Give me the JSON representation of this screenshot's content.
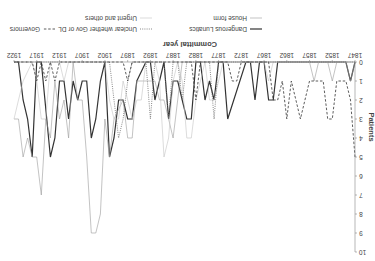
{
  "chart_data": {
    "type": "line",
    "title": "",
    "xlabel": "Committal year",
    "ylabel": "Patients",
    "xlim": [
      1847,
      1922
    ],
    "ylim": [
      0,
      10
    ],
    "x_ticks": [
      1847,
      1852,
      1857,
      1862,
      1867,
      1872,
      1877,
      1882,
      1887,
      1892,
      1897,
      1902,
      1907,
      1912,
      1917,
      1922
    ],
    "y_ticks": [
      0,
      1,
      2,
      3,
      4,
      5,
      6,
      7,
      8,
      9,
      10
    ],
    "grid": false,
    "legend_position": "bottom",
    "orientation_note": "image rendered rotated 180 degrees",
    "series": [
      {
        "name": "Dangerous Lunatics",
        "style": "solid-thick",
        "color": "#333333",
        "points": [
          [
            1847,
            0
          ],
          [
            1848,
            1
          ],
          [
            1849,
            0
          ],
          [
            1864,
            0
          ],
          [
            1865,
            2
          ],
          [
            1866,
            2
          ],
          [
            1867,
            0
          ],
          [
            1868,
            0
          ],
          [
            1869,
            2
          ],
          [
            1870,
            0
          ],
          [
            1871,
            0
          ],
          [
            1875,
            3
          ],
          [
            1876,
            0
          ],
          [
            1877,
            0
          ],
          [
            1878,
            2
          ],
          [
            1879,
            1
          ],
          [
            1880,
            2
          ],
          [
            1881,
            0
          ],
          [
            1882,
            0
          ],
          [
            1883,
            3
          ],
          [
            1884,
            3
          ],
          [
            1885,
            2
          ],
          [
            1886,
            1
          ],
          [
            1887,
            1
          ],
          [
            1888,
            3
          ],
          [
            1889,
            0
          ],
          [
            1890,
            1
          ],
          [
            1891,
            2
          ],
          [
            1892,
            0
          ],
          [
            1893,
            0
          ],
          [
            1895,
            1
          ],
          [
            1896,
            3
          ],
          [
            1897,
            3
          ],
          [
            1898,
            2
          ],
          [
            1899,
            2
          ],
          [
            1900,
            4
          ],
          [
            1901,
            5
          ],
          [
            1902,
            0
          ],
          [
            1903,
            1
          ],
          [
            1904,
            3
          ],
          [
            1905,
            4
          ],
          [
            1906,
            1
          ],
          [
            1907,
            1
          ],
          [
            1908,
            2
          ],
          [
            1909,
            1
          ],
          [
            1910,
            3
          ],
          [
            1911,
            1
          ],
          [
            1912,
            1
          ],
          [
            1913,
            4
          ],
          [
            1914,
            5
          ],
          [
            1916,
            0
          ],
          [
            1917,
            0
          ],
          [
            1918,
            5
          ],
          [
            1919,
            3
          ],
          [
            1920,
            2
          ],
          [
            1921,
            0
          ],
          [
            1922,
            0
          ]
        ]
      },
      {
        "name": "House form",
        "style": "solid-thin",
        "color": "#aaaaaa",
        "points": [
          [
            1847,
            0
          ],
          [
            1848,
            1
          ],
          [
            1849,
            0
          ],
          [
            1851,
            0
          ],
          [
            1852,
            1
          ],
          [
            1853,
            0
          ],
          [
            1855,
            0
          ],
          [
            1856,
            1
          ],
          [
            1857,
            0
          ],
          [
            1885,
            0
          ],
          [
            1886,
            2
          ],
          [
            1887,
            4
          ],
          [
            1888,
            3
          ],
          [
            1889,
            2
          ],
          [
            1890,
            2
          ],
          [
            1891,
            1
          ],
          [
            1895,
            1
          ],
          [
            1896,
            4
          ],
          [
            1897,
            4
          ],
          [
            1898,
            2
          ],
          [
            1900,
            3
          ],
          [
            1901,
            5
          ],
          [
            1902,
            3
          ],
          [
            1903,
            8
          ],
          [
            1904,
            9
          ],
          [
            1905,
            9
          ],
          [
            1906,
            5
          ],
          [
            1907,
            2
          ],
          [
            1908,
            2
          ],
          [
            1909,
            0
          ],
          [
            1910,
            4
          ],
          [
            1911,
            2
          ],
          [
            1912,
            3
          ],
          [
            1913,
            1
          ],
          [
            1914,
            4
          ],
          [
            1915,
            3
          ],
          [
            1916,
            7
          ],
          [
            1917,
            5
          ],
          [
            1918,
            5
          ],
          [
            1919,
            4
          ],
          [
            1920,
            5
          ],
          [
            1921,
            3
          ],
          [
            1922,
            3
          ]
        ]
      },
      {
        "name": "Urgent and others",
        "style": "solid-thin",
        "color": "#cccccc",
        "points": [
          [
            1847,
            0
          ],
          [
            1865,
            0
          ],
          [
            1866,
            1
          ],
          [
            1867,
            0
          ],
          [
            1876,
            0
          ],
          [
            1877,
            1
          ],
          [
            1878,
            2
          ],
          [
            1879,
            2
          ],
          [
            1880,
            0
          ],
          [
            1881,
            1
          ],
          [
            1882,
            2
          ],
          [
            1883,
            4
          ],
          [
            1884,
            4
          ],
          [
            1885,
            1
          ],
          [
            1886,
            0
          ],
          [
            1887,
            1
          ],
          [
            1888,
            4
          ],
          [
            1889,
            5
          ],
          [
            1890,
            1
          ],
          [
            1891,
            0
          ],
          [
            1893,
            0
          ],
          [
            1894,
            2
          ],
          [
            1895,
            2
          ],
          [
            1896,
            3
          ],
          [
            1897,
            2
          ],
          [
            1898,
            1
          ],
          [
            1899,
            3
          ],
          [
            1900,
            3
          ],
          [
            1901,
            2
          ],
          [
            1902,
            0
          ],
          [
            1904,
            0
          ],
          [
            1905,
            0
          ],
          [
            1910,
            0
          ],
          [
            1911,
            1
          ],
          [
            1912,
            0
          ],
          [
            1914,
            0
          ],
          [
            1915,
            3
          ],
          [
            1916,
            3
          ],
          [
            1917,
            1
          ],
          [
            1918,
            0
          ],
          [
            1920,
            1
          ],
          [
            1921,
            2
          ],
          [
            1922,
            3
          ]
        ]
      },
      {
        "name": "Unclear whether Gov or DL",
        "style": "dotted",
        "color": "#777777",
        "points": [
          [
            1847,
            0
          ],
          [
            1877,
            0
          ],
          [
            1878,
            3
          ],
          [
            1879,
            0
          ],
          [
            1884,
            0
          ],
          [
            1885,
            2
          ],
          [
            1886,
            0
          ],
          [
            1887,
            0
          ],
          [
            1888,
            3
          ],
          [
            1889,
            0
          ],
          [
            1891,
            0
          ],
          [
            1892,
            3
          ],
          [
            1893,
            0
          ],
          [
            1896,
            0
          ],
          [
            1897,
            1
          ],
          [
            1898,
            3
          ],
          [
            1899,
            4
          ],
          [
            1900,
            2
          ],
          [
            1901,
            0
          ],
          [
            1922,
            0
          ]
        ]
      },
      {
        "name": "Governors",
        "style": "dashed",
        "color": "#333333",
        "points": [
          [
            1847,
            5
          ],
          [
            1848,
            2
          ],
          [
            1849,
            1
          ],
          [
            1850,
            1
          ],
          [
            1851,
            1
          ],
          [
            1852,
            3
          ],
          [
            1853,
            3
          ],
          [
            1854,
            1
          ],
          [
            1856,
            1
          ],
          [
            1857,
            1
          ],
          [
            1859,
            3
          ],
          [
            1860,
            2
          ],
          [
            1861,
            1
          ],
          [
            1862,
            3
          ],
          [
            1863,
            1
          ],
          [
            1864,
            2
          ],
          [
            1865,
            2
          ],
          [
            1866,
            0
          ],
          [
            1870,
            0
          ],
          [
            1872,
            0
          ],
          [
            1873,
            1
          ],
          [
            1874,
            1
          ],
          [
            1875,
            0
          ],
          [
            1881,
            0
          ],
          [
            1882,
            2
          ],
          [
            1883,
            0
          ],
          [
            1896,
            0
          ],
          [
            1897,
            1
          ],
          [
            1898,
            0
          ],
          [
            1912,
            0
          ],
          [
            1913,
            1
          ],
          [
            1914,
            0
          ],
          [
            1915,
            1
          ],
          [
            1916,
            0
          ],
          [
            1917,
            1
          ],
          [
            1918,
            0
          ],
          [
            1922,
            0
          ]
        ]
      }
    ]
  },
  "axes": {
    "x_title": "Committal year",
    "y_title": "Patients"
  },
  "legend": {
    "items": [
      {
        "label": "House form",
        "style": "solid-thin"
      },
      {
        "label": "Dangerous Lunatics",
        "style": "solid-thick"
      },
      {
        "label": "Urgent and others",
        "style": "solid-thin-light"
      },
      {
        "label": "Unclear whether Gov or DL",
        "style": "dotted"
      },
      {
        "label": "Governors",
        "style": "dashed"
      }
    ]
  }
}
